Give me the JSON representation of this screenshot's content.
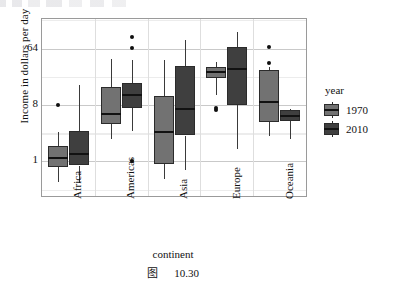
{
  "figure": {
    "caption_prefix": "图",
    "caption_number": "10.30"
  },
  "legend": {
    "title": "year",
    "position": "right",
    "items": [
      {
        "label": "1970",
        "color": "#727272"
      },
      {
        "label": "2010",
        "color": "#3f3f3f"
      }
    ]
  },
  "axes": {
    "ylabel": "Income in dollars per day",
    "xlabel": "continent",
    "yticks": [
      "1",
      "8",
      "64"
    ]
  },
  "chart_data": {
    "type": "box",
    "title": "",
    "xlabel": "continent",
    "ylabel": "Income in dollars per day",
    "yscale": "log2",
    "yticks": [
      1,
      8,
      64
    ],
    "ylim": [
      0.28,
      190
    ],
    "grid": true,
    "legend_position": "right",
    "legend_title": "year",
    "categories": [
      "Africa",
      "Americas",
      "Asia",
      "Europe",
      "Oceania"
    ],
    "series": [
      {
        "name": "1970",
        "color": "#727272",
        "boxes": [
          {
            "category": "Africa",
            "whisker_low": 0.46,
            "q1": 0.82,
            "median": 1.15,
            "q3": 1.75,
            "whisker_high": 3.0,
            "outliers": [
              7.9
            ]
          },
          {
            "category": "Americas",
            "whisker_low": 2.3,
            "q1": 4.0,
            "median": 5.7,
            "q3": 15.5,
            "whisker_high": 43.0,
            "outliers": []
          },
          {
            "category": "Asia",
            "whisker_low": 0.52,
            "q1": 0.9,
            "median": 3.0,
            "q3": 11.0,
            "whisker_high": 42.0,
            "outliers": []
          },
          {
            "category": "Europe",
            "whisker_low": 11.5,
            "q1": 22.0,
            "median": 27.0,
            "q3": 32.0,
            "whisker_high": 39.0,
            "outliers": [
              6.6,
              7.2
            ]
          },
          {
            "category": "Oceania",
            "whisker_low": 2.5,
            "q1": 4.3,
            "median": 9.0,
            "q3": 29.0,
            "whisker_high": 32.0,
            "outliers": [
              67.0,
              38.0
            ]
          }
        ]
      },
      {
        "name": "2010",
        "color": "#3f3f3f",
        "boxes": [
          {
            "category": "Africa",
            "whisker_low": 0.45,
            "q1": 0.86,
            "median": 1.32,
            "q3": 3.1,
            "whisker_high": 17.0,
            "outliers": []
          },
          {
            "category": "Americas",
            "whisker_low": 3.1,
            "q1": 7.3,
            "median": 11.5,
            "q3": 18.0,
            "whisker_high": 42.0,
            "outliers": [
              98.0,
              66.0,
              1.0
            ]
          },
          {
            "category": "Asia",
            "whisker_low": 0.72,
            "q1": 2.6,
            "median": 7.0,
            "q3": 34.0,
            "whisker_high": 88.0,
            "outliers": []
          },
          {
            "category": "Europe",
            "whisker_low": 1.6,
            "q1": 7.9,
            "median": 30.0,
            "q3": 68.0,
            "whisker_high": 120.0,
            "outliers": []
          },
          {
            "category": "Oceania",
            "whisker_low": 2.3,
            "q1": 4.5,
            "median": 5.4,
            "q3": 6.7,
            "whisker_high": 6.9,
            "outliers": []
          }
        ]
      }
    ]
  }
}
